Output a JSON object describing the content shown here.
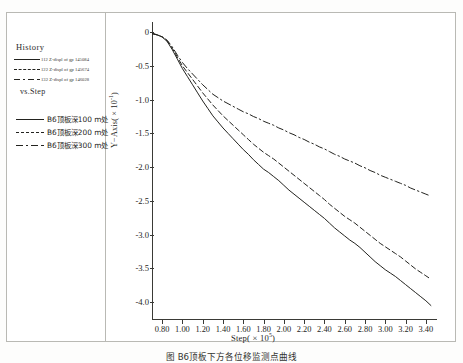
{
  "figure": {
    "caption": "图     B6顶板下方各位移监测点曲线"
  },
  "legend": {
    "title": "History",
    "vs_label": "vs.Step",
    "history_items": [
      {
        "style": "solid",
        "text": "112  Z-displ  of  gp  145084"
      },
      {
        "style": "dashed",
        "text": "122  Z-displ  of  gp  145674"
      },
      {
        "style": "dashdot",
        "text": "132  Z-displ  of  gp  146028"
      }
    ],
    "series_items": [
      {
        "style": "solid",
        "text": "B6顶板深100  m处"
      },
      {
        "style": "dashed",
        "text": "B6顶板深200  m处"
      },
      {
        "style": "dashdot",
        "text": "B6顶板深300  m处"
      }
    ]
  },
  "chart_data": {
    "type": "line",
    "title": "",
    "xlabel": "Step( × 10",
    "xlabel_exp": "5",
    "xlabel_tail": ")",
    "ylabel": "Y−Axis( × 10",
    "ylabel_exp": "-1",
    "ylabel_tail": ")",
    "xlim": [
      0.7,
      3.5
    ],
    "ylim": [
      -4.25,
      0.15
    ],
    "grid": false,
    "legend_position": "left-panel",
    "xticks": [
      "0.80",
      "1.00",
      "1.20",
      "1.40",
      "1.60",
      "1.80",
      "2.00",
      "2.20",
      "2.40",
      "2.60",
      "2.80",
      "3.00",
      "3.20",
      "3.40"
    ],
    "xtick_values": [
      0.8,
      1.0,
      1.2,
      1.4,
      1.6,
      1.8,
      2.0,
      2.2,
      2.4,
      2.6,
      2.8,
      3.0,
      3.2,
      3.4
    ],
    "yticks": [
      "0",
      "-0.5",
      "-1.0",
      "-1.5",
      "-2.0",
      "-2.5",
      "-3.0",
      "-3.5",
      "-4.0"
    ],
    "ytick_values": [
      0,
      -0.5,
      -1.0,
      -1.5,
      -2.0,
      -2.5,
      -3.0,
      -3.5,
      -4.0
    ],
    "x": [
      0.7,
      0.75,
      0.8,
      0.85,
      0.9,
      0.95,
      1.0,
      1.05,
      1.1,
      1.15,
      1.2,
      1.25,
      1.3,
      1.35,
      1.4,
      1.45,
      1.5,
      1.55,
      1.6,
      1.65,
      1.7,
      1.75,
      1.8,
      1.85,
      1.9,
      1.95,
      2.0,
      2.05,
      2.1,
      2.15,
      2.2,
      2.25,
      2.3,
      2.35,
      2.4,
      2.45,
      2.5,
      2.55,
      2.6,
      2.65,
      2.7,
      2.75,
      2.8,
      2.85,
      2.9,
      2.95,
      3.0,
      3.05,
      3.1,
      3.15,
      3.2,
      3.25,
      3.3,
      3.35,
      3.4,
      3.45
    ],
    "series": [
      {
        "name": "B6顶板深100  m处",
        "style": "solid",
        "values": [
          -0.02,
          -0.04,
          -0.07,
          -0.14,
          -0.26,
          -0.4,
          -0.54,
          -0.66,
          -0.78,
          -0.9,
          -1.02,
          -1.13,
          -1.24,
          -1.33,
          -1.42,
          -1.5,
          -1.58,
          -1.66,
          -1.74,
          -1.81,
          -1.89,
          -1.96,
          -2.03,
          -2.08,
          -2.14,
          -2.2,
          -2.27,
          -2.34,
          -2.4,
          -2.46,
          -2.52,
          -2.58,
          -2.64,
          -2.7,
          -2.76,
          -2.83,
          -2.9,
          -2.96,
          -3.02,
          -3.08,
          -3.13,
          -3.19,
          -3.26,
          -3.33,
          -3.4,
          -3.46,
          -3.52,
          -3.57,
          -3.62,
          -3.68,
          -3.74,
          -3.8,
          -3.86,
          -3.92,
          -3.98,
          -4.05
        ]
      },
      {
        "name": "B6顶板深200  m处",
        "style": "dashed",
        "values": [
          -0.02,
          -0.04,
          -0.07,
          -0.13,
          -0.24,
          -0.37,
          -0.5,
          -0.6,
          -0.7,
          -0.8,
          -0.9,
          -0.99,
          -1.08,
          -1.16,
          -1.24,
          -1.31,
          -1.38,
          -1.45,
          -1.52,
          -1.59,
          -1.66,
          -1.72,
          -1.78,
          -1.83,
          -1.88,
          -1.94,
          -2.0,
          -2.06,
          -2.12,
          -2.18,
          -2.24,
          -2.3,
          -2.36,
          -2.42,
          -2.48,
          -2.55,
          -2.61,
          -2.67,
          -2.73,
          -2.78,
          -2.83,
          -2.89,
          -2.95,
          -3.01,
          -3.07,
          -3.13,
          -3.18,
          -3.23,
          -3.28,
          -3.33,
          -3.39,
          -3.45,
          -3.51,
          -3.56,
          -3.61,
          -3.66
        ]
      },
      {
        "name": "B6顶板深300  m处",
        "style": "dashdot",
        "values": [
          -0.02,
          -0.04,
          -0.07,
          -0.12,
          -0.22,
          -0.34,
          -0.45,
          -0.54,
          -0.62,
          -0.7,
          -0.78,
          -0.85,
          -0.92,
          -0.97,
          -1.02,
          -1.06,
          -1.1,
          -1.14,
          -1.18,
          -1.21,
          -1.25,
          -1.28,
          -1.32,
          -1.35,
          -1.38,
          -1.42,
          -1.45,
          -1.49,
          -1.52,
          -1.56,
          -1.59,
          -1.63,
          -1.66,
          -1.7,
          -1.73,
          -1.77,
          -1.81,
          -1.84,
          -1.88,
          -1.91,
          -1.94,
          -1.98,
          -2.01,
          -2.05,
          -2.08,
          -2.12,
          -2.15,
          -2.18,
          -2.21,
          -2.24,
          -2.27,
          -2.31,
          -2.34,
          -2.37,
          -2.4,
          -2.43
        ]
      }
    ]
  }
}
